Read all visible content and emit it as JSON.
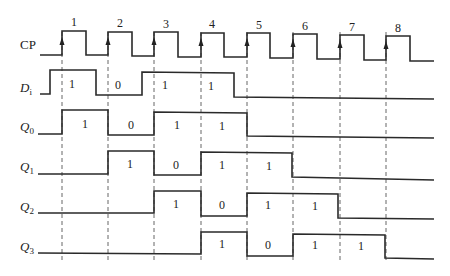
{
  "diagram": {
    "type": "timing-diagram",
    "clock": {
      "label": "CP",
      "pulse_numbers": [
        "1",
        "2",
        "3",
        "4",
        "5",
        "6",
        "7",
        "8"
      ],
      "rising_edges_x": [
        62,
        108,
        154,
        201,
        247,
        293,
        340,
        386
      ],
      "falling_edges_x": [
        86,
        132,
        178,
        224,
        270,
        317,
        364,
        410
      ]
    },
    "signals": [
      {
        "name": "Di",
        "label_main": "D",
        "label_sub": "i",
        "bits": [
          "1",
          "0",
          "1",
          "1"
        ],
        "bit_x": [
          72,
          118,
          165,
          211
        ]
      },
      {
        "name": "Q0",
        "label_main": "Q",
        "label_sub": "0",
        "bits": [
          "1",
          "0",
          "1",
          "1"
        ],
        "bit_x": [
          85,
          131,
          177,
          222
        ]
      },
      {
        "name": "Q1",
        "label_main": "Q",
        "label_sub": "1",
        "bits": [
          "1",
          "0",
          "1",
          "1"
        ],
        "bit_x": [
          130,
          176,
          222,
          269
        ]
      },
      {
        "name": "Q2",
        "label_main": "Q",
        "label_sub": "2",
        "bits": [
          "1",
          "0",
          "1",
          "1"
        ],
        "bit_x": [
          176,
          222,
          268,
          315
        ]
      },
      {
        "name": "Q3",
        "label_main": "Q",
        "label_sub": "3",
        "bits": [
          "1",
          "0",
          "1",
          "1"
        ],
        "bit_x": [
          222,
          268,
          315,
          361
        ]
      }
    ]
  }
}
